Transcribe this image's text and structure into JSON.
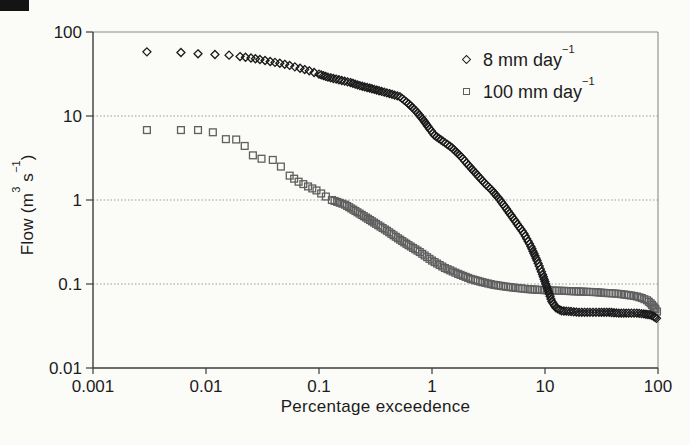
{
  "figure": {
    "background_color": "#fbfbf8",
    "scan_artifact_color": "#141414"
  },
  "axes": {
    "x_title": {
      "text": "Percentage exceedence"
    },
    "y_title": {
      "p1": "Flow (m",
      "s1": "3",
      "p2": " s",
      "s2": "−1",
      "p3": ")"
    },
    "x_tick_labels": [
      "0.001",
      "0.01",
      "0.1",
      "1",
      "10",
      "100"
    ],
    "y_tick_labels": [
      "100",
      "10",
      "1",
      "0.1",
      "0.01"
    ]
  },
  "legend": {
    "items": [
      {
        "text": "8 mm day",
        "sup": "−1",
        "marker": "diamond"
      },
      {
        "text": "100 mm day",
        "sup": "−1",
        "marker": "square"
      }
    ]
  },
  "style": {
    "grid_color": "#9a9a9a",
    "frame_color": "#8a8a8a",
    "axis_color": "#3c3c3c",
    "tick_label_color": "#1c1c1c",
    "tick_font_px": 17,
    "marker_size": 8,
    "marker_stroke": 1.3
  },
  "chart_data": {
    "type": "scatter",
    "title": "",
    "xlabel": "Percentage exceedence",
    "ylabel": "Flow (m3 s-1)",
    "x_scale": "log",
    "y_scale": "log",
    "xlim": [
      0.001,
      100
    ],
    "ylim": [
      0.01,
      100
    ],
    "x_ticks": [
      0.001,
      0.01,
      0.1,
      1,
      10,
      100
    ],
    "y_ticks": [
      100,
      10,
      1,
      0.1,
      0.01
    ],
    "y_gridlines": [
      10,
      1,
      0.1
    ],
    "grid": "horizontal-only",
    "legend_position": "inside-upper-right",
    "series": [
      {
        "name": "8 mm day-1",
        "marker": "diamond",
        "color": "#1a1a1a",
        "render_hints": {
          "dense_from_x": 0.018,
          "dense_step_px": 8,
          "solid_from_x": 0.085,
          "solid_step_px": 3
        },
        "points": [
          [
            0.003,
            58
          ],
          [
            0.006,
            57
          ],
          [
            0.0085,
            55
          ],
          [
            0.012,
            54
          ],
          [
            0.016,
            53
          ],
          [
            0.02,
            51
          ],
          [
            0.025,
            49
          ],
          [
            0.03,
            47
          ],
          [
            0.037,
            44.5
          ],
          [
            0.045,
            42.5
          ],
          [
            0.055,
            40
          ],
          [
            0.068,
            37
          ],
          [
            0.082,
            34.5
          ],
          [
            0.1,
            31.5
          ],
          [
            0.12,
            29
          ],
          [
            0.15,
            27
          ],
          [
            0.19,
            25
          ],
          [
            0.23,
            23
          ],
          [
            0.28,
            21.5
          ],
          [
            0.34,
            20
          ],
          [
            0.42,
            18.5
          ],
          [
            0.52,
            17
          ],
          [
            0.62,
            14
          ],
          [
            0.72,
            11.5
          ],
          [
            0.82,
            9.3
          ],
          [
            0.92,
            7.5
          ],
          [
            1.05,
            5.9
          ],
          [
            1.25,
            5.0
          ],
          [
            1.5,
            4.2
          ],
          [
            1.8,
            3.3
          ],
          [
            2.1,
            2.6
          ],
          [
            2.5,
            2.0
          ],
          [
            2.9,
            1.6
          ],
          [
            3.4,
            1.3
          ],
          [
            4.0,
            1.0
          ],
          [
            4.7,
            0.74
          ],
          [
            5.5,
            0.55
          ],
          [
            6.5,
            0.4
          ],
          [
            7.5,
            0.28
          ],
          [
            8.5,
            0.19
          ],
          [
            9.5,
            0.13
          ],
          [
            10.5,
            0.088
          ],
          [
            11.5,
            0.062
          ],
          [
            12.5,
            0.052
          ],
          [
            14,
            0.048
          ],
          [
            17,
            0.047
          ],
          [
            20,
            0.046
          ],
          [
            25,
            0.046
          ],
          [
            30,
            0.046
          ],
          [
            37,
            0.046
          ],
          [
            45,
            0.045
          ],
          [
            55,
            0.045
          ],
          [
            65,
            0.045
          ],
          [
            75,
            0.044
          ],
          [
            85,
            0.043
          ],
          [
            92,
            0.041
          ],
          [
            97,
            0.039
          ]
        ]
      },
      {
        "name": "100 mm day-1",
        "marker": "square",
        "color": "#5f5f5f",
        "render_hints": {
          "dense_from_x": 0.05,
          "dense_step_px": 8,
          "solid_from_x": 0.13,
          "solid_step_px": 3
        },
        "points": [
          [
            0.003,
            6.8
          ],
          [
            0.006,
            6.8
          ],
          [
            0.0085,
            6.8
          ],
          [
            0.0115,
            6.4
          ],
          [
            0.015,
            5.3
          ],
          [
            0.0185,
            5.25
          ],
          [
            0.022,
            4.4
          ],
          [
            0.026,
            3.4
          ],
          [
            0.031,
            3.1
          ],
          [
            0.039,
            3.0
          ],
          [
            0.046,
            2.5
          ],
          [
            0.055,
            1.95
          ],
          [
            0.066,
            1.65
          ],
          [
            0.08,
            1.45
          ],
          [
            0.095,
            1.3
          ],
          [
            0.115,
            1.1
          ],
          [
            0.13,
            1.0
          ],
          [
            0.17,
            0.88
          ],
          [
            0.21,
            0.74
          ],
          [
            0.26,
            0.62
          ],
          [
            0.32,
            0.52
          ],
          [
            0.4,
            0.43
          ],
          [
            0.5,
            0.35
          ],
          [
            0.62,
            0.29
          ],
          [
            0.78,
            0.24
          ],
          [
            1.0,
            0.19
          ],
          [
            1.3,
            0.155
          ],
          [
            1.7,
            0.132
          ],
          [
            2.2,
            0.115
          ],
          [
            2.8,
            0.105
          ],
          [
            3.5,
            0.098
          ],
          [
            4.5,
            0.093
          ],
          [
            5.5,
            0.09
          ],
          [
            7,
            0.087
          ],
          [
            9,
            0.085
          ],
          [
            11,
            0.084
          ],
          [
            14,
            0.083
          ],
          [
            18,
            0.082
          ],
          [
            22,
            0.081
          ],
          [
            28,
            0.08
          ],
          [
            35,
            0.078
          ],
          [
            42,
            0.077
          ],
          [
            50,
            0.075
          ],
          [
            58,
            0.073
          ],
          [
            65,
            0.071
          ],
          [
            72,
            0.068
          ],
          [
            80,
            0.064
          ],
          [
            86,
            0.059
          ],
          [
            91,
            0.054
          ],
          [
            95,
            0.05
          ],
          [
            98,
            0.047
          ]
        ]
      }
    ]
  }
}
